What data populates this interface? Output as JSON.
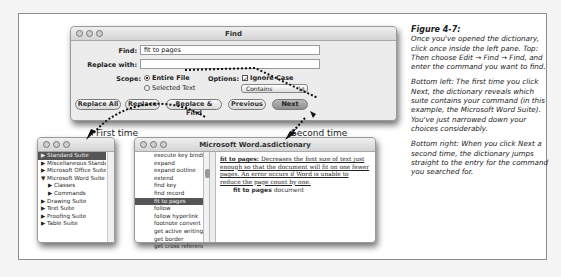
{
  "find_dialog": {
    "title": "Find",
    "find_label": "Find:",
    "find_value": "fit to pages",
    "replace_label": "Replace with:",
    "replace_value": "",
    "scope_label": "Scope:",
    "scope_options": [
      "Entire File",
      "Selected Text"
    ],
    "scope_selected": "Entire File",
    "options_label": "Options:",
    "ignore_case_label": "Ignore Case",
    "ignore_case_checked": true,
    "match_popup_value": "Contains",
    "buttons": [
      "Replace All",
      "Replace",
      "Replace & Find",
      "Previous",
      "Next"
    ]
  },
  "callouts": {
    "first": "First time",
    "second": "Second time"
  },
  "suite_window": {
    "items": [
      {
        "label": "Standard Suite",
        "selected": true,
        "indent": 0,
        "arrow": "▶"
      },
      {
        "label": "Miscellaneous Standards",
        "indent": 0,
        "arrow": "▶"
      },
      {
        "label": "Microsoft Office Suite",
        "indent": 0,
        "arrow": "▶"
      },
      {
        "label": "Microsoft Word Suite",
        "indent": 0,
        "arrow": "▼"
      },
      {
        "label": "Classes",
        "indent": 1,
        "arrow": "▶"
      },
      {
        "label": "Commands",
        "indent": 1,
        "arrow": "▶"
      },
      {
        "label": "Drawing Suite",
        "indent": 0,
        "arrow": "▶"
      },
      {
        "label": "Text Suite",
        "indent": 0,
        "arrow": "▶"
      },
      {
        "label": "Proofing Suite",
        "indent": 0,
        "arrow": "▶"
      },
      {
        "label": "Table Suite",
        "indent": 0,
        "arrow": "▶"
      }
    ]
  },
  "dict_window": {
    "title": "Microsoft Word.asdictionary",
    "commands": [
      "execute key binding",
      "expand",
      "expand outline",
      "extend",
      "find key",
      "find record",
      "fit to pages",
      "follow",
      "follow hyperlink",
      "footnote convert",
      "get active writing s",
      "get border",
      "get cross reference"
    ],
    "selected_command": "fit to pages",
    "entry_term": "fit to pages:",
    "entry_text": "Decreases the font size of text just enough so that the document will fit on one fewer pages. An error occurs if Word is unable to reduce the page count by one.",
    "signature_cmd": "fit to pages",
    "signature_param": "document"
  },
  "caption": {
    "title": "Figure 4-7:",
    "paragraphs": [
      "Once you've opened the dictionary, click once inside the left pane. Top: Then choose Edit → Find → Find, and enter the command you want to find.",
      "Bottom left: The first time you click Next, the dictionary reveals which suite contains your command (in this example, the Microsoft Word Suite). You've just narrowed down your choices considerably.",
      "Bottom right: When you click Next a second time, the dictionary jumps straight to the entry for the command you searched for."
    ]
  }
}
